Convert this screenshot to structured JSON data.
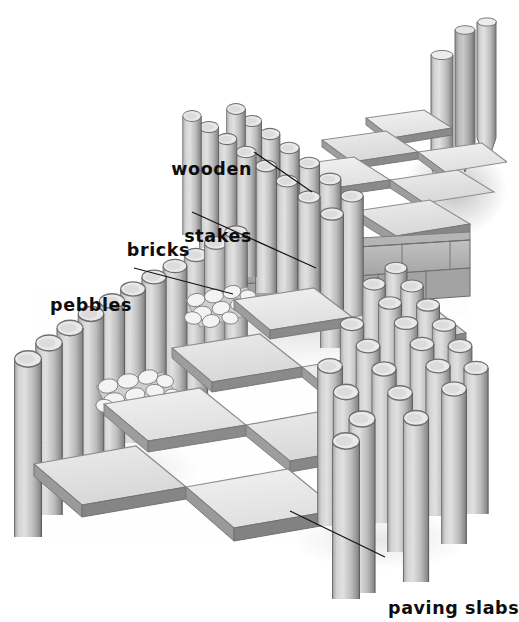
{
  "illustration": {
    "title": "Garden path construction cutaway",
    "subject": "paved garden path edged with wooden stakes, brick course and pebble infill",
    "background_color": "#ffffff",
    "ink_color": "#0d0d0d",
    "palette": {
      "slab_face": "#e3e3e3",
      "slab_face_light": "#ededed",
      "slab_edge": "#9a9a9a",
      "slab_edge_dark": "#7d7d7d",
      "stake_body": "#c6c6c6",
      "stake_shade": "#8f8f8f",
      "stake_top": "#e9e9e9",
      "brick_face": "#b0b0b0",
      "brick_dark": "#8c8c8c",
      "pebble": "#f2f2f2",
      "pebble_line": "#8a8a8a",
      "shadow": "#b9b9b9"
    }
  },
  "labels": [
    {
      "id": "wooden-stakes",
      "line1": "wooden",
      "line2": "stakes",
      "align": "right",
      "x": 140,
      "y": 113,
      "width": 112,
      "leader": {
        "x1": 254,
        "y1": 152,
        "x2": 312,
        "y2": 192
      }
    },
    {
      "id": "bricks",
      "line1": "bricks",
      "line2": "",
      "align": "right",
      "x": 104,
      "y": 194,
      "width": 86,
      "leader": {
        "x1": 192,
        "y1": 212,
        "x2": 316,
        "y2": 268
      }
    },
    {
      "id": "pebbles",
      "line1": "pebbles",
      "line2": "",
      "align": "right",
      "x": 26,
      "y": 249,
      "width": 106,
      "leader": {
        "x1": 134,
        "y1": 268,
        "x2": 233,
        "y2": 294
      }
    },
    {
      "id": "paving-slabs",
      "line1": "paving slabs",
      "line2": "",
      "align": "left",
      "x": 388,
      "y": 552,
      "width": 118,
      "leader": {
        "x1": 385,
        "y1": 557,
        "x2": 290,
        "y2": 511
      }
    }
  ],
  "components": [
    {
      "name": "wooden stakes",
      "description": "round timber posts driven vertically to edge the path, shown with pointed ends"
    },
    {
      "name": "bricks",
      "description": "single staggered course of bricks forming a step riser across the path"
    },
    {
      "name": "pebbles",
      "description": "rounded stones filling the narrow strips between slabs and stake edging"
    },
    {
      "name": "paving slabs",
      "description": "square concrete slabs laid in a grid forming the path surface"
    }
  ]
}
